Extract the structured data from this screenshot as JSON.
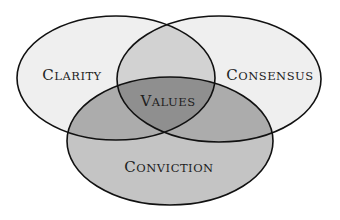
{
  "diagram": {
    "type": "venn",
    "sets": [
      {
        "id": "clarity",
        "label_first": "C",
        "label_rest": "LARITY",
        "label": "Clarity"
      },
      {
        "id": "consensus",
        "label_first": "C",
        "label_rest": "ONSENSUS",
        "label": "Consensus"
      },
      {
        "id": "conviction",
        "label_first": "C",
        "label_rest": "ONVICTION",
        "label": "Conviction"
      }
    ],
    "center": {
      "label_first": "V",
      "label_rest": "ALUES",
      "label": "Values"
    },
    "colors": {
      "background": "#ffffff",
      "single": "#efefef",
      "conviction": "#c4c4c4",
      "pair_top": "#d2d2d2",
      "pair_bottom": "#a9a9a9",
      "center": "#8f8f8f",
      "stroke": "#111111"
    }
  }
}
